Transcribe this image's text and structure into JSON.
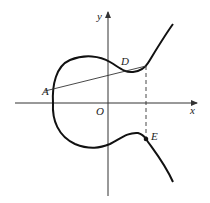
{
  "diagram": {
    "axes": {
      "x_label": "x",
      "y_label": "y",
      "origin_label": "O"
    },
    "points": [
      {
        "label": "A",
        "description": "leftmost point of curve on secant line"
      },
      {
        "label": "D",
        "description": "point on upper branch, right end of chord from A"
      },
      {
        "label": "E",
        "description": "point on lower branch, vertically below D (dashed line)"
      }
    ],
    "elements": [
      "cubic-like curve (upper and lower branches)",
      "chord from A to D",
      "dashed vertical line from D to E"
    ],
    "colors": {
      "curve": "#111111",
      "axes": "#333333",
      "chord": "#333333"
    }
  }
}
